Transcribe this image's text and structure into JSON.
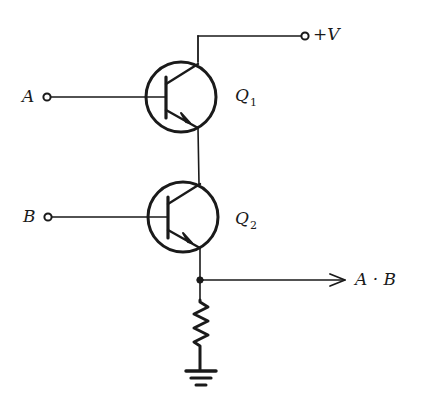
{
  "diagram": {
    "type": "circuit-schematic",
    "labels": {
      "supply": "+V",
      "input_a": "A",
      "input_b": "B",
      "q1_name": "Q",
      "q1_sub": "1",
      "q2_name": "Q",
      "q2_sub": "2",
      "output": "A · B"
    },
    "components": [
      {
        "id": "Q1",
        "type": "npn-transistor",
        "base": "A",
        "collector": "+V",
        "emitter": "Q2 collector"
      },
      {
        "id": "Q2",
        "type": "npn-transistor",
        "base": "B",
        "collector": "Q1 emitter",
        "emitter": "output node"
      },
      {
        "id": "R",
        "type": "resistor",
        "from": "output node",
        "to": "ground"
      },
      {
        "id": "GND",
        "type": "ground"
      }
    ],
    "colors": {
      "ink": "#1a1a1a",
      "background": "#ffffff"
    }
  }
}
